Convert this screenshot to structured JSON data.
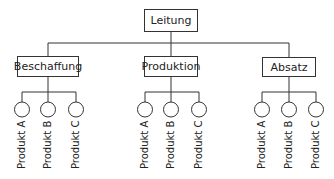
{
  "diagram": {
    "type": "organigram",
    "root": {
      "label": "Leitung"
    },
    "departments": [
      {
        "label": "Beschaffung",
        "products": [
          "Produkt A",
          "Produkt B",
          "Produkt C"
        ]
      },
      {
        "label": "Produktion",
        "products": [
          "Produkt A",
          "Produkt B",
          "Produkt C"
        ]
      },
      {
        "label": "Absatz",
        "products": [
          "Produkt A",
          "Produkt B",
          "Produkt C"
        ]
      }
    ],
    "colors": {
      "line": "#333333",
      "text": "#222222",
      "background": "#ffffff"
    }
  }
}
